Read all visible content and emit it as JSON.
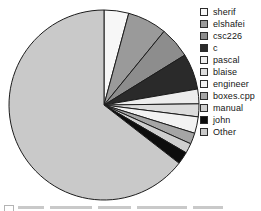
{
  "chart_data": {
    "type": "pie",
    "title": "",
    "subtitle": "",
    "xlabel": "",
    "ylabel": "",
    "grid": false,
    "legend_position": "right",
    "start_angle_deg": 0,
    "direction": "clockwise",
    "categories": [
      "sherif",
      "elshafei",
      "csc226",
      "c",
      "pascal",
      "blaise",
      "engineer",
      "boxes.cpp",
      "manual",
      "john",
      "Other"
    ],
    "values": [
      4.2,
      6.7,
      5.3,
      6.1,
      2.5,
      2.2,
      2.8,
      1.9,
      1.7,
      2.1,
      64.5
    ],
    "colors": [
      "#f7f7f7",
      "#9a9a9a",
      "#8d8d8d",
      "#2a2a2a",
      "#ededed",
      "#dcdcdc",
      "#f2f2f2",
      "#a5a5a5",
      "#cfcfcf",
      "#0d0d0d",
      "#c9c9c9"
    ],
    "slices": [
      {
        "label": "sherif",
        "value": 4.2,
        "color": "#f7f7f7",
        "start_deg": 0,
        "end_deg": 15.1
      },
      {
        "label": "elshafei",
        "value": 6.7,
        "color": "#9a9a9a",
        "start_deg": 15.1,
        "end_deg": 39.2
      },
      {
        "label": "csc226",
        "value": 5.3,
        "color": "#8d8d8d",
        "start_deg": 39.2,
        "end_deg": 58.3
      },
      {
        "label": "c",
        "value": 6.1,
        "color": "#2a2a2a",
        "start_deg": 58.3,
        "end_deg": 80.3
      },
      {
        "label": "pascal",
        "value": 2.5,
        "color": "#ededed",
        "start_deg": 80.3,
        "end_deg": 89.3
      },
      {
        "label": "blaise",
        "value": 2.2,
        "color": "#dcdcdc",
        "start_deg": 89.3,
        "end_deg": 97.2
      },
      {
        "label": "engineer",
        "value": 2.8,
        "color": "#f2f2f2",
        "start_deg": 97.2,
        "end_deg": 107.3
      },
      {
        "label": "boxes.cpp",
        "value": 1.9,
        "color": "#a5a5a5",
        "start_deg": 107.3,
        "end_deg": 114.1
      },
      {
        "label": "manual",
        "value": 1.7,
        "color": "#cfcfcf",
        "start_deg": 114.1,
        "end_deg": 120.2
      },
      {
        "label": "john",
        "value": 2.1,
        "color": "#0d0d0d",
        "start_deg": 120.2,
        "end_deg": 127.8
      },
      {
        "label": "Other",
        "value": 64.5,
        "color": "#c9c9c9",
        "start_deg": 127.8,
        "end_deg": 360
      }
    ],
    "geometry": {
      "center_x": 98,
      "center_y": 99,
      "radius": 95,
      "stroke_color": "#1c1c1c",
      "stroke_width": 1
    }
  },
  "legend": {
    "items": [
      {
        "label": "sherif",
        "color": "#f7f7f7"
      },
      {
        "label": "elshafei",
        "color": "#9a9a9a"
      },
      {
        "label": "csc226",
        "color": "#8d8d8d"
      },
      {
        "label": "c",
        "color": "#2a2a2a"
      },
      {
        "label": "pascal",
        "color": "#ededed"
      },
      {
        "label": "blaise",
        "color": "#dcdcdc"
      },
      {
        "label": "engineer",
        "color": "#f2f2f2"
      },
      {
        "label": "boxes.cpp",
        "color": "#a5a5a5"
      },
      {
        "label": "manual",
        "color": "#cfcfcf"
      },
      {
        "label": "john",
        "color": "#0d0d0d"
      },
      {
        "label": "Other",
        "color": "#c9c9c9"
      }
    ]
  }
}
